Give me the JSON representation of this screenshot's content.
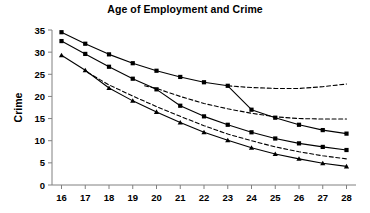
{
  "chart_data": {
    "type": "line",
    "title": "Age of Employment and Crime",
    "xlabel": "",
    "ylabel": "Crime",
    "x": [
      16,
      17,
      18,
      19,
      20,
      21,
      22,
      23,
      24,
      25,
      26,
      27,
      28
    ],
    "xlim": [
      15.6,
      28.4
    ],
    "ylim": [
      0,
      35
    ],
    "xticks": [
      16,
      17,
      18,
      19,
      20,
      21,
      22,
      23,
      24,
      25,
      26,
      27,
      28
    ],
    "yticks": [
      0,
      5,
      10,
      15,
      20,
      25,
      30,
      35
    ],
    "grid": false,
    "legend": "none",
    "series": [
      {
        "name": "top-solid-square",
        "style": "solid",
        "marker": "square",
        "color": "#000000",
        "x": [
          16,
          17,
          18,
          19,
          20,
          21,
          22,
          23,
          24,
          25,
          26,
          27,
          28
        ],
        "values": [
          34.5,
          31.9,
          29.5,
          27.5,
          25.8,
          24.4,
          23.2,
          22.4,
          17.0,
          15.2,
          13.6,
          12.4,
          11.6
        ]
      },
      {
        "name": "upper-dashed-projection",
        "style": "dashed",
        "marker": "none",
        "color": "#000000",
        "x": [
          23,
          24,
          25,
          26,
          27,
          28
        ],
        "values": [
          22.4,
          22.0,
          21.8,
          21.8,
          22.2,
          22.8
        ]
      },
      {
        "name": "middle-solid-square",
        "style": "solid",
        "marker": "square",
        "color": "#000000",
        "x": [
          16,
          17,
          18,
          19,
          20,
          21,
          22,
          23,
          24,
          25,
          26,
          27,
          28
        ],
        "values": [
          32.5,
          29.6,
          26.7,
          24.0,
          21.6,
          17.9,
          15.5,
          13.6,
          11.9,
          10.5,
          9.4,
          8.6,
          7.9
        ]
      },
      {
        "name": "middle-dashed-projection",
        "style": "dashed",
        "marker": "none",
        "color": "#000000",
        "x": [
          19.5,
          20,
          21,
          22,
          23,
          24,
          25,
          26,
          27,
          28
        ],
        "values": [
          22.4,
          21.8,
          20.0,
          18.4,
          17.2,
          16.2,
          15.4,
          15.0,
          14.9,
          14.9
        ]
      },
      {
        "name": "bottom-solid-triangle",
        "style": "solid",
        "marker": "triangle",
        "color": "#000000",
        "x": [
          16,
          17,
          18,
          19,
          20,
          21,
          22,
          23,
          24,
          25,
          26,
          27,
          28
        ],
        "values": [
          29.3,
          25.9,
          21.9,
          19.0,
          16.5,
          14.1,
          11.9,
          10.1,
          8.4,
          7.0,
          5.9,
          4.9,
          4.2
        ]
      },
      {
        "name": "lower-dashed-projection",
        "style": "dashed",
        "marker": "none",
        "color": "#000000",
        "x": [
          17.1,
          18,
          19,
          20,
          21,
          22,
          23,
          24,
          25,
          26,
          27,
          28
        ],
        "values": [
          25.4,
          22.6,
          20.1,
          17.7,
          15.5,
          13.4,
          11.5,
          10.0,
          8.6,
          7.5,
          6.6,
          5.9
        ]
      }
    ]
  }
}
